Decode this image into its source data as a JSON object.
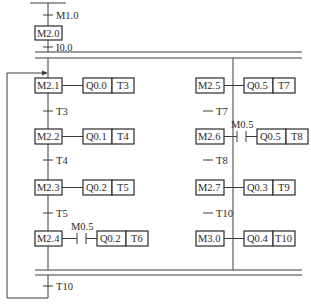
{
  "diagram": {
    "type": "sequential function chart (SFC) with parallel branches",
    "initial": {
      "top_transition": "M1.0",
      "initial_step": "M2.0",
      "after_transition": "I0.0"
    },
    "left_branch": {
      "steps": [
        {
          "step": "M2.1",
          "actions": [
            "Q0.0",
            "T3"
          ],
          "condition": ""
        },
        {
          "step": "M2.2",
          "actions": [
            "Q0.1",
            "T4"
          ],
          "condition": ""
        },
        {
          "step": "M2.3",
          "actions": [
            "Q0.2",
            "T5"
          ],
          "condition": ""
        },
        {
          "step": "M2.4",
          "actions": [
            "Q0.2",
            "T6"
          ],
          "condition": "M0.5"
        }
      ],
      "transitions": [
        "T3",
        "T4",
        "T5"
      ]
    },
    "right_branch": {
      "steps": [
        {
          "step": "M2.5",
          "actions": [
            "Q0.5",
            "T7"
          ],
          "condition": ""
        },
        {
          "step": "M2.6",
          "actions": [
            "Q0.5",
            "T8"
          ],
          "condition": "M0.5"
        },
        {
          "step": "M2.7",
          "actions": [
            "Q0.3",
            "T9"
          ],
          "condition": ""
        },
        {
          "step": "M3.0",
          "actions": [
            "Q0.4",
            "T10"
          ],
          "condition": ""
        }
      ],
      "transitions": [
        "T7",
        "T8",
        "T10"
      ]
    },
    "final_transition": "T10"
  }
}
